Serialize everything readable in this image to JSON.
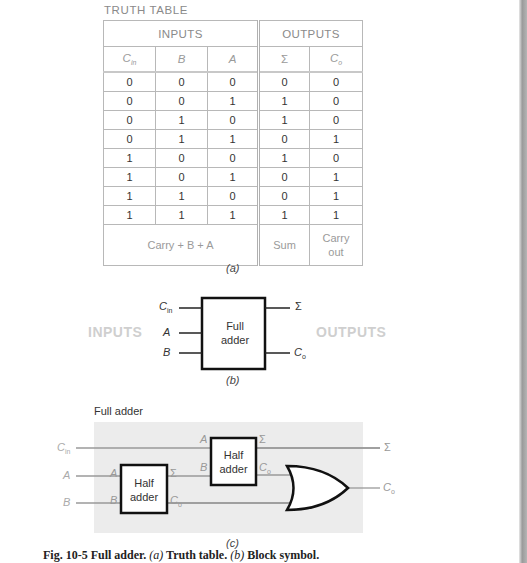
{
  "truth_table": {
    "title": "TRUTH TABLE",
    "group_headers": {
      "inputs": "INPUTS",
      "outputs": "OUTPUTS"
    },
    "columns": [
      {
        "symbol": "C",
        "sub": "in"
      },
      {
        "symbol": "B",
        "sub": ""
      },
      {
        "symbol": "A",
        "sub": ""
      },
      {
        "symbol": "Σ",
        "sub": ""
      },
      {
        "symbol": "C",
        "sub": "o"
      }
    ],
    "rows": [
      [
        "0",
        "0",
        "0",
        "0",
        "0"
      ],
      [
        "0",
        "0",
        "1",
        "1",
        "0"
      ],
      [
        "0",
        "1",
        "0",
        "1",
        "0"
      ],
      [
        "0",
        "1",
        "1",
        "0",
        "1"
      ],
      [
        "1",
        "0",
        "0",
        "1",
        "0"
      ],
      [
        "1",
        "0",
        "1",
        "0",
        "1"
      ],
      [
        "1",
        "1",
        "0",
        "0",
        "1"
      ],
      [
        "1",
        "1",
        "1",
        "1",
        "1"
      ]
    ],
    "footer": {
      "inputs": "Carry + B + A",
      "sum": "Sum",
      "carry_line1": "Carry",
      "carry_line2": "out"
    },
    "caption": "(a)"
  },
  "block_symbol": {
    "box_label_line1": "Full",
    "box_label_line2": "adder",
    "inputs_label": "INPUTS",
    "outputs_label": "OUTPUTS",
    "in_cin": "C",
    "in_cin_sub": "in",
    "in_a": "A",
    "in_b": "B",
    "out_sum": "Σ",
    "out_co": "C",
    "out_co_sub": "o",
    "caption": "(b)"
  },
  "logic_diagram": {
    "title": "Full adder",
    "inputs": {
      "cin": "C",
      "cin_sub": "in",
      "a": "A",
      "b": "B"
    },
    "half_adder_1": {
      "label_line1": "Half",
      "label_line2": "adder",
      "pin_a": "A",
      "pin_b": "B",
      "pin_sum": "Σ",
      "pin_co": "C",
      "pin_co_sub": "o"
    },
    "half_adder_2": {
      "label_line1": "Half",
      "label_line2": "adder",
      "pin_a": "A",
      "pin_b": "B",
      "pin_sum": "Σ",
      "pin_co": "C",
      "pin_co_sub": "o"
    },
    "gate": "OR",
    "outputs": {
      "sum": "Σ",
      "co": "C",
      "co_sub": "o"
    },
    "caption": "(c)"
  },
  "figure_caption": {
    "prefix": "Fig. 10-5   Full adder. ",
    "a": "(a)",
    "a_text": " Truth table. ",
    "b": "(b)",
    "b_text": " Block symbol."
  }
}
